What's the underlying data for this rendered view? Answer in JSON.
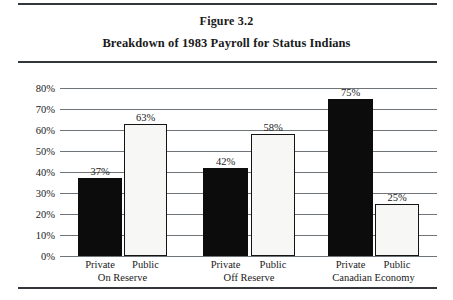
{
  "figure": {
    "label": "Figure 3.2",
    "title": "Breakdown of 1983 Payroll for Status Indians"
  },
  "chart_data": {
    "type": "bar",
    "title": "Breakdown of 1983 Payroll for Status Indians",
    "xlabel": "",
    "ylabel": "",
    "ylim": [
      0,
      80
    ],
    "grid": true,
    "legend": "none",
    "categories": [
      "Private",
      "Public",
      "Private",
      "Public",
      "Private",
      "Public"
    ],
    "values": [
      37,
      58,
      42,
      58,
      75,
      25
    ],
    "bars": [
      {
        "sector": "Private",
        "group": "On Reserve",
        "value": 37,
        "label": "37%",
        "style": "dark"
      },
      {
        "sector": "Public",
        "group": "On Reserve",
        "value": 63,
        "label": "63%",
        "style": "light"
      },
      {
        "sector": "Private",
        "group": "Off Reserve",
        "value": 42,
        "label": "42%",
        "style": "dark"
      },
      {
        "sector": "Public",
        "group": "Off Reserve",
        "value": 58,
        "label": "58%",
        "style": "light"
      },
      {
        "sector": "Private",
        "group": "Canadian Economy",
        "value": 75,
        "label": "75%",
        "style": "dark"
      },
      {
        "sector": "Public",
        "group": "Canadian Economy",
        "value": 25,
        "label": "25%",
        "style": "light"
      }
    ],
    "groups": [
      {
        "name": "On Reserve"
      },
      {
        "name": "Off Reserve"
      },
      {
        "name": "Canadian Economy"
      }
    ],
    "yticks": [
      "80%",
      "70%",
      "60%",
      "50%",
      "40%",
      "30%",
      "20%",
      "10%",
      "0%"
    ],
    "ytick_values": [
      80,
      70,
      60,
      50,
      40,
      30,
      20,
      10,
      0
    ]
  },
  "colors": {
    "dark_bar": "#0c0c0c",
    "light_bar": "#f7f7f5",
    "bar_outline": "#141414",
    "gridline": "#6f7478",
    "rule": "#33363b",
    "text": "#1a1a1a"
  }
}
